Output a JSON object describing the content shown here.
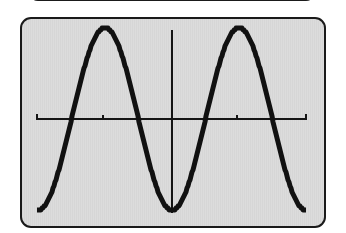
{
  "device": "graphing-calculator",
  "screen": {
    "background": "#d9d9d9",
    "border_color": "#1a1a1a",
    "plot_color": "#111111"
  },
  "graph": {
    "function": "y = -cos(x)",
    "x_ticks_px": [
      103,
      237
    ],
    "origin_px": [
      172,
      119
    ],
    "x_axis_px": [
      36,
      307
    ],
    "y_axis_px": [
      30,
      213
    ],
    "period_px": 134,
    "amplitude_px": 91
  }
}
